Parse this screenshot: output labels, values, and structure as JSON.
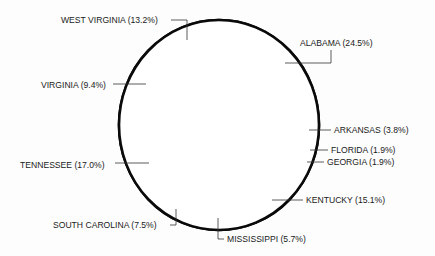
{
  "chart_data": {
    "type": "pie",
    "title": "",
    "start": "top",
    "direction": "clockwise",
    "slices": [
      {
        "label": "ALABAMA",
        "value": 24.5,
        "text": "ALABAMA (24.5%)"
      },
      {
        "label": "ARKANSAS",
        "value": 3.8,
        "text": "ARKANSAS (3.8%)"
      },
      {
        "label": "FLORIDA",
        "value": 1.9,
        "text": "FLORIDA (1.9%)"
      },
      {
        "label": "GEORGIA",
        "value": 1.9,
        "text": "GEORGIA (1.9%)"
      },
      {
        "label": "KENTUCKY",
        "value": 15.1,
        "text": "KENTUCKY (15.1%)"
      },
      {
        "label": "MISSISSIPPI",
        "value": 5.7,
        "text": "MISSISSIPPI (5.7%)"
      },
      {
        "label": "SOUTH CAROLINA",
        "value": 7.5,
        "text": "SOUTH CAROLINA (7.5%)"
      },
      {
        "label": "TENNESSEE",
        "value": 17.0,
        "text": "TENNESSEE (17.0%)"
      },
      {
        "label": "VIRGINIA",
        "value": 9.4,
        "text": "VIRGINIA (9.4%)"
      },
      {
        "label": "WEST VIRGINIA",
        "value": 13.2,
        "text": "WEST VIRGINIA (13.2%)"
      }
    ],
    "legend": "none",
    "colors": {
      "fill": "#ffffff",
      "stroke": "#000000"
    }
  }
}
